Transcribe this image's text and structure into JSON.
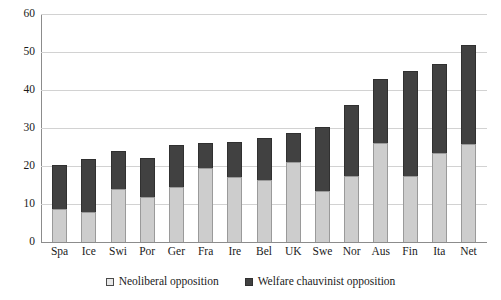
{
  "chart_data": {
    "type": "bar",
    "subtype": "stacked-vertical",
    "title": "",
    "xlabel": "",
    "ylabel": "",
    "ylim": [
      0,
      60
    ],
    "ytick_step": 10,
    "yticks": [
      60,
      50,
      40,
      30,
      20,
      10,
      0
    ],
    "grid": true,
    "legend_position": "bottom-center",
    "categories": [
      "Spa",
      "Ice",
      "Swi",
      "Por",
      "Ger",
      "Fra",
      "Ire",
      "Bel",
      "UK",
      "Swe",
      "Nor",
      "Aus",
      "Fin",
      "Ita",
      "Net"
    ],
    "series": [
      {
        "name": "Neoliberal opposition",
        "color": "#cdcdcd",
        "values": [
          8.8,
          8.0,
          14.0,
          11.8,
          14.5,
          19.5,
          17.0,
          16.3,
          21.0,
          13.5,
          17.5,
          26.0,
          17.3,
          23.3,
          25.7
        ]
      },
      {
        "name": "Welfare chauvinist opposition",
        "color": "#414141",
        "values": [
          11.4,
          13.8,
          10.0,
          10.2,
          11.0,
          6.6,
          9.3,
          11.0,
          7.7,
          16.8,
          18.5,
          17.0,
          27.7,
          23.5,
          26.1
        ]
      }
    ],
    "totals": [
      20.2,
      21.8,
      24.0,
      22.0,
      25.5,
      26.1,
      26.3,
      27.3,
      28.7,
      30.3,
      36.0,
      43.0,
      45.0,
      46.8,
      51.8
    ]
  },
  "legend": {
    "items": [
      {
        "label": "Neoliberal opposition",
        "marker": "light-square"
      },
      {
        "label": "Welfare chauvinist opposition",
        "marker": "dark-square"
      }
    ]
  }
}
